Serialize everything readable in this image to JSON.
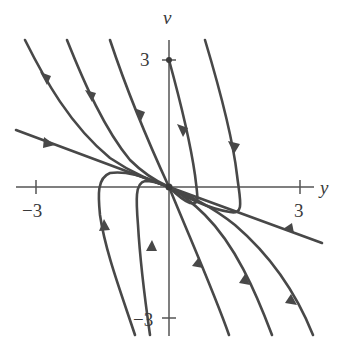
{
  "figure": {
    "type": "phase-portrait",
    "axes": {
      "horizontal_label": "y",
      "vertical_label": "v",
      "ticks": {
        "y_neg": "−3",
        "y_pos": "3",
        "v_pos": "3",
        "v_neg": "−3"
      },
      "range": {
        "y": [
          -3.6,
          3.5
        ],
        "v": [
          -3.4,
          3.5
        ]
      }
    },
    "equilibrium": {
      "label": "origin",
      "y": 0,
      "v": 0,
      "type": "stable node (sink)"
    },
    "marked_point": {
      "y": 0,
      "v": 3
    },
    "eigenline_slope_approx": -0.4,
    "colors": {
      "curve": "#484848",
      "axis": "#555555",
      "text": "#3a3a3a",
      "background": "#ffffff"
    }
  },
  "trajectories": [
    {
      "name": "upper-left-1",
      "direction": "toward origin"
    },
    {
      "name": "upper-left-2",
      "direction": "toward origin"
    },
    {
      "name": "upper-left-3",
      "direction": "toward origin"
    },
    {
      "name": "slow-eigenline",
      "direction": "toward origin from both sides"
    },
    {
      "name": "from-v3",
      "direction": "down, loops, then toward origin"
    },
    {
      "name": "upper-right",
      "direction": "down, loops, then toward origin"
    },
    {
      "name": "lower-left-1",
      "direction": "up, loops, then toward origin"
    },
    {
      "name": "lower-left-2",
      "direction": "up, loops, then toward origin"
    },
    {
      "name": "lower-right-1",
      "direction": "up toward origin"
    },
    {
      "name": "lower-right-2",
      "direction": "up toward origin"
    },
    {
      "name": "lower-right-3",
      "direction": "up toward origin"
    }
  ]
}
